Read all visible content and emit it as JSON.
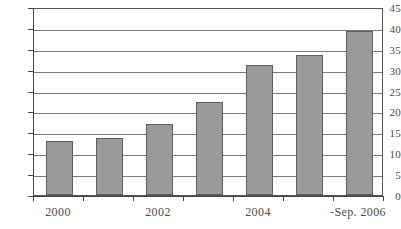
{
  "chart_data": {
    "type": "bar",
    "title": "",
    "subtitle": "",
    "xlabel": "",
    "ylabel": "",
    "categories": [
      "2000",
      "2001",
      "2002",
      "2003",
      "2004",
      "2005",
      "-Sep. 2006"
    ],
    "values": [
      13.0,
      13.7,
      17.1,
      22.3,
      31.2,
      33.4,
      39.2
    ],
    "ylim": [
      0,
      45
    ],
    "y_ticks": [
      0,
      5,
      10,
      15,
      20,
      25,
      30,
      35,
      40,
      45
    ],
    "y_tick_labels": [
      "0",
      "5",
      "10",
      "15",
      "20",
      "25",
      "30",
      "35",
      "40",
      "45"
    ],
    "x_tick_labels": [
      "2000",
      "2002",
      "2004",
      "-Sep. 2006"
    ],
    "x_tick_label_positions": [
      0,
      2,
      4,
      6
    ],
    "grid": true,
    "grid_axis": "y",
    "legend": false,
    "legend_position": "none",
    "series": [
      {
        "name": "",
        "values": [
          13.0,
          13.7,
          17.1,
          22.3,
          31.2,
          33.4,
          39.2
        ]
      }
    ]
  },
  "style": {
    "bar_fill": "#9a9a9a",
    "bar_border": "#5e5e5e",
    "gridline_color": "#7a7a7a",
    "axis_color": "#444444",
    "text_color": "#4a4a4a",
    "background": "#ffffff"
  }
}
